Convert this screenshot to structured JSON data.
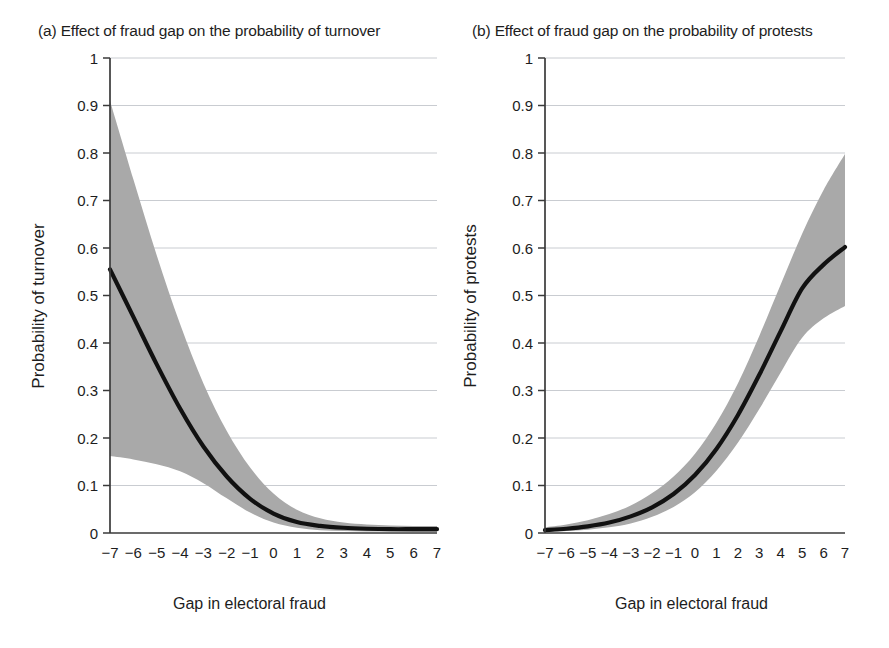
{
  "figure": {
    "panels": [
      {
        "id": "a",
        "title": "(a) Effect of fraud gap on the probability of turnover",
        "ylabel": "Probability of turnover",
        "xlabel": "Gap in electoral fraud"
      },
      {
        "id": "b",
        "title": "(b) Effect of fraud gap on the probability of protests",
        "ylabel": "Probability of protests",
        "xlabel": "Gap in electoral fraud"
      }
    ],
    "colors": {
      "line": "#111111",
      "band": "#a9a9a9",
      "grid": "#c9ccd1",
      "axis": "#3a3a3a",
      "text": "#1d1d1d"
    }
  },
  "chart_data": [
    {
      "type": "line",
      "panel": "a",
      "title": "(a) Effect of fraud gap on the probability of turnover",
      "xlabel": "Gap in electoral fraud",
      "ylabel": "Probability of turnover",
      "xlim": [
        -7,
        7
      ],
      "ylim": [
        0,
        1
      ],
      "grid": true,
      "legend": "none",
      "xticks": [
        -7,
        -6,
        -5,
        -4,
        -3,
        -2,
        -1,
        0,
        1,
        2,
        3,
        4,
        5,
        6,
        7
      ],
      "xtick_labels": [
        "−7",
        "−6",
        "−5",
        "−4",
        "−3",
        "−2",
        "−1",
        "0",
        "1",
        "2",
        "3",
        "4",
        "5",
        "6",
        "7"
      ],
      "yticks": [
        0,
        0.1,
        0.2,
        0.3,
        0.4,
        0.5,
        0.6,
        0.7,
        0.8,
        0.9,
        1
      ],
      "ytick_labels": [
        "0",
        "0.1",
        "0.2",
        "0.3",
        "0.4",
        "0.5",
        "0.6",
        "0.7",
        "0.8",
        "0.9",
        "1"
      ],
      "x": [
        -7,
        -6,
        -5,
        -4,
        -3,
        -2,
        -1,
        0,
        1,
        2,
        3,
        4,
        5,
        6,
        7
      ],
      "series": [
        {
          "name": "Predicted probability of turnover",
          "values": [
            0.555,
            0.455,
            0.355,
            0.262,
            0.182,
            0.119,
            0.072,
            0.041,
            0.023,
            0.015,
            0.011,
            0.009,
            0.008,
            0.008,
            0.008
          ]
        }
      ],
      "confidence_band": {
        "name": "95% confidence interval",
        "upper": [
          0.91,
          0.745,
          0.585,
          0.44,
          0.315,
          0.215,
          0.138,
          0.083,
          0.049,
          0.031,
          0.022,
          0.018,
          0.016,
          0.015,
          0.015
        ],
        "lower": [
          0.162,
          0.155,
          0.145,
          0.13,
          0.105,
          0.073,
          0.043,
          0.022,
          0.011,
          0.006,
          0.004,
          0.003,
          0.003,
          0.002,
          0.002
        ]
      }
    },
    {
      "type": "line",
      "panel": "b",
      "title": "(b) Effect of fraud gap on the probability of protests",
      "xlabel": "Gap in electoral fraud",
      "ylabel": "Probability of protests",
      "xlim": [
        -7,
        7
      ],
      "ylim": [
        0,
        1
      ],
      "grid": true,
      "legend": "none",
      "xticks": [
        -7,
        -6,
        -5,
        -4,
        -3,
        -2,
        -1,
        0,
        1,
        2,
        3,
        4,
        5,
        6,
        7
      ],
      "xtick_labels": [
        "−7",
        "−6",
        "−5",
        "−4",
        "−3",
        "−2",
        "−1",
        "0",
        "1",
        "2",
        "3",
        "4",
        "5",
        "6",
        "7"
      ],
      "yticks": [
        0,
        0.1,
        0.2,
        0.3,
        0.4,
        0.5,
        0.6,
        0.7,
        0.8,
        0.9,
        1
      ],
      "ytick_labels": [
        "0",
        "0.1",
        "0.2",
        "0.3",
        "0.4",
        "0.5",
        "0.6",
        "0.7",
        "0.8",
        "0.9",
        "1"
      ],
      "x": [
        -7,
        -6,
        -5,
        -4,
        -3,
        -2,
        -1,
        0,
        1,
        2,
        3,
        4,
        5,
        6,
        7
      ],
      "series": [
        {
          "name": "Predicted probability of protests",
          "values": [
            0.006,
            0.009,
            0.014,
            0.022,
            0.035,
            0.054,
            0.082,
            0.122,
            0.177,
            0.248,
            0.333,
            0.425,
            0.515,
            0.565,
            0.602
          ]
        }
      ],
      "confidence_band": {
        "name": "95% confidence interval",
        "upper": [
          0.012,
          0.018,
          0.027,
          0.04,
          0.058,
          0.084,
          0.119,
          0.167,
          0.232,
          0.315,
          0.415,
          0.523,
          0.63,
          0.722,
          0.798
        ],
        "lower": [
          0.002,
          0.004,
          0.007,
          0.012,
          0.02,
          0.034,
          0.055,
          0.086,
          0.131,
          0.19,
          0.261,
          0.338,
          0.411,
          0.452,
          0.478
        ]
      }
    }
  ]
}
